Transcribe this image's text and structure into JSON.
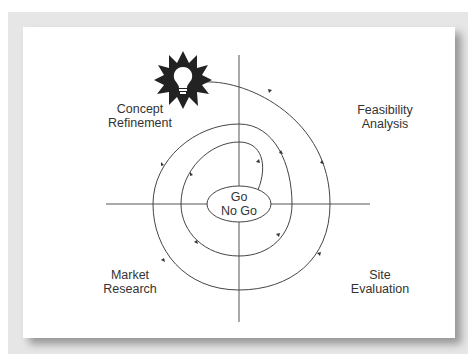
{
  "diagram": {
    "title": "",
    "center_label": {
      "line1": "Go",
      "line2": "No Go"
    },
    "quadrants": {
      "top_left": {
        "line1": "Concept",
        "line2": "Refinement"
      },
      "top_right": {
        "line1": "Feasibility",
        "line2": "Analysis"
      },
      "bottom_right": {
        "line1": "Site",
        "line2": "Evaluation"
      },
      "bottom_left": {
        "line1": "Market",
        "line2": "Research"
      }
    },
    "start_icon": "lightbulb-starburst-icon",
    "flow": "Clockwise spiral from idea (lightbulb) through Feasibility Analysis, Site Evaluation, Market Research, Concept Refinement, repeating inward to Go / No Go decision",
    "colors": {
      "line": "#444444",
      "starburst": "#222222",
      "frame": "#e6e6e6",
      "panel": "#ffffff"
    }
  }
}
